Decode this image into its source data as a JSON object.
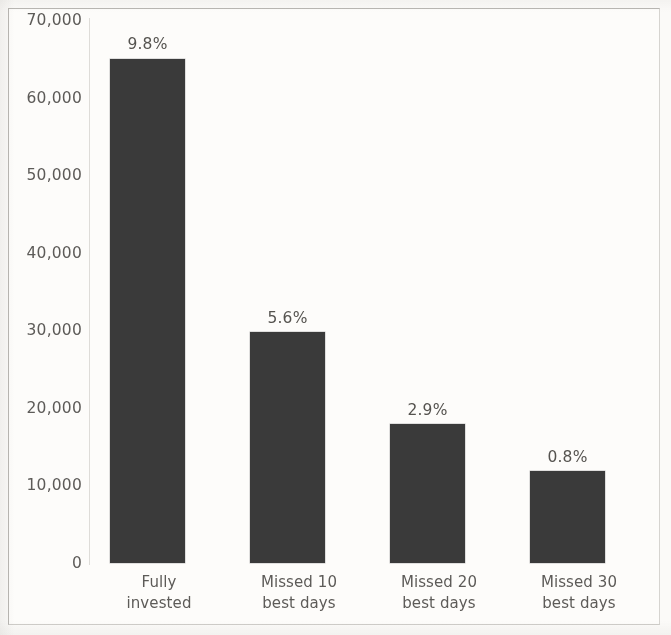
{
  "chart_data": {
    "type": "bar",
    "title": "",
    "subtitle": "",
    "xlabel": "",
    "ylabel": "",
    "categories": [
      "Fully invested",
      "Missed 10 best days",
      "Missed 20 best days",
      "Missed 30 best days"
    ],
    "category_lines": [
      [
        "Fully",
        "invested"
      ],
      [
        "Missed 10",
        "best days"
      ],
      [
        "Missed 20",
        "best days"
      ],
      [
        "Missed 30",
        "best days"
      ]
    ],
    "values": [
      64800,
      29700,
      17800,
      11800
    ],
    "data_labels": [
      "9.8%",
      "5.6%",
      "2.9%",
      "0.8%"
    ],
    "ylim": [
      0,
      70000
    ],
    "yticks": [
      0,
      10000,
      20000,
      30000,
      40000,
      50000,
      60000,
      70000
    ],
    "ytick_labels": [
      "0",
      "10,000",
      "20,000",
      "30,000",
      "40,000",
      "50,000",
      "60,000",
      "70,000"
    ],
    "grid": false,
    "legend": null,
    "series": [
      {
        "name": "Ending value",
        "values": [
          64800,
          29700,
          17800,
          11800
        ],
        "color": "#3a3a3a"
      }
    ]
  },
  "style": {
    "bar_color": "#3a3a3a",
    "text_color": "#5d5b58",
    "axis_color": "#dedcd8",
    "frame_color": "#b9b7b3",
    "background": "#fdfcfa"
  }
}
